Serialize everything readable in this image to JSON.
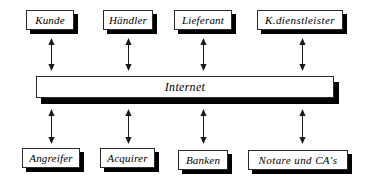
{
  "figure": {
    "title": "",
    "hub": {
      "label": "Internet",
      "icon": "network-bus"
    },
    "top_nodes": [
      {
        "label": "Kunde",
        "icon": "box-node"
      },
      {
        "label": "Händler",
        "icon": "box-node"
      },
      {
        "label": "Lieferant",
        "icon": "box-node"
      },
      {
        "label": "K.dienstleister",
        "icon": "box-node"
      }
    ],
    "bottom_nodes": [
      {
        "label": "Angreifer",
        "icon": "box-node"
      },
      {
        "label": "Acquirer",
        "icon": "box-node"
      },
      {
        "label": "Banken",
        "icon": "box-node"
      },
      {
        "label": "Notare und CA's",
        "icon": "box-node"
      }
    ],
    "connectors": [
      {
        "icon": "double-arrow-vertical",
        "from": "Kunde",
        "to": "Internet"
      },
      {
        "icon": "double-arrow-vertical",
        "from": "Händler",
        "to": "Internet"
      },
      {
        "icon": "double-arrow-vertical",
        "from": "Lieferant",
        "to": "Internet"
      },
      {
        "icon": "double-arrow-vertical",
        "from": "K.dienstleister",
        "to": "Internet"
      },
      {
        "icon": "double-arrow-vertical",
        "from": "Internet",
        "to": "Angreifer"
      },
      {
        "icon": "double-arrow-vertical",
        "from": "Internet",
        "to": "Acquirer"
      },
      {
        "icon": "double-arrow-vertical",
        "from": "Internet",
        "to": "Banken"
      },
      {
        "icon": "double-arrow-vertical",
        "from": "Internet",
        "to": "Notare und CA's"
      }
    ],
    "colors": {
      "background": "#ffffff",
      "box_fill": "#ffffff",
      "box_border": "#2b2b2b",
      "shadow": "#000000",
      "text": "#000000",
      "arrow": "#1a1a1a"
    }
  }
}
